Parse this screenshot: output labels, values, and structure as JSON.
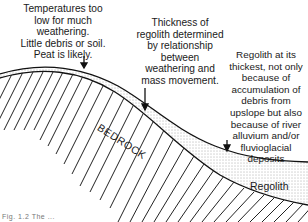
{
  "diagram": {
    "annotations": [
      {
        "id": "upland",
        "text": "Temperatures too\nlow for much\nweathering.\nLittle debris or soil.\nPeat is likely."
      },
      {
        "id": "slope",
        "text": "Thickness of\nregolith determined\nby relationship\nbetween\nweathering and\nmass movement."
      },
      {
        "id": "valley",
        "text": "Regolith at its\nthickest, not only\nbecause of\naccumulation of\ndebris from\nupslope but also\nbecause of river\nalluvium and/or\nfluvioglacial deposits"
      }
    ],
    "layers": {
      "bedrock": "BEDROCK",
      "regolith": "Regolith"
    },
    "caption": "Fig. 1.2 The ..."
  }
}
